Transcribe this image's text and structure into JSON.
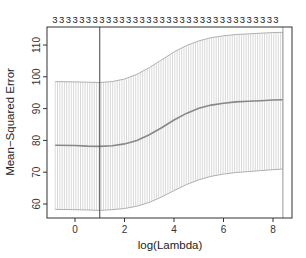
{
  "chart_data": {
    "type": "line",
    "title": "",
    "xlabel": "log(Lambda)",
    "ylabel": "Mean−Squared Error",
    "xlim": [
      -1.1,
      8.75
    ],
    "ylim": [
      56.5,
      115.5
    ],
    "x_ticks": [
      0,
      2,
      4,
      6,
      8
    ],
    "x_tick_labels": [
      "0",
      "2",
      "4",
      "6",
      "8"
    ],
    "y_ticks": [
      60,
      70,
      80,
      90,
      100,
      110
    ],
    "y_tick_labels": [
      "60",
      "70",
      "80",
      "90",
      "100",
      "110"
    ],
    "grid": false,
    "legend": null,
    "top_axis_label_value": "3",
    "top_axis_label_count": 34,
    "vertical_lines": [
      {
        "name": "lambda.min",
        "x": 1.0
      },
      {
        "name": "lambda.1se",
        "x": 8.4
      }
    ],
    "series": [
      {
        "name": "cv mean",
        "x": [
          -0.8,
          0.0,
          0.5,
          1.0,
          1.5,
          2.0,
          2.5,
          3.0,
          3.5,
          4.0,
          4.5,
          5.0,
          5.5,
          6.0,
          6.5,
          7.0,
          7.5,
          8.0,
          8.4
        ],
        "y": [
          78.5,
          78.4,
          78.2,
          78.1,
          78.3,
          78.9,
          80.0,
          81.8,
          84.0,
          86.4,
          88.5,
          90.1,
          91.1,
          91.7,
          92.1,
          92.3,
          92.5,
          92.7,
          92.8
        ]
      },
      {
        "name": "upper band (mean + 1 SE)",
        "x": [
          -0.8,
          0.0,
          0.5,
          1.0,
          1.5,
          2.0,
          2.5,
          3.0,
          3.5,
          4.0,
          4.5,
          5.0,
          5.5,
          6.0,
          6.5,
          7.0,
          7.5,
          8.0,
          8.4
        ],
        "y": [
          98.5,
          98.4,
          98.3,
          98.2,
          98.5,
          99.3,
          100.8,
          102.9,
          105.3,
          107.8,
          109.8,
          111.3,
          112.3,
          112.9,
          113.3,
          113.5,
          113.7,
          113.9,
          114.0
        ]
      },
      {
        "name": "lower band (mean - 1 SE)",
        "x": [
          -0.8,
          0.0,
          0.5,
          1.0,
          1.5,
          2.0,
          2.5,
          3.0,
          3.5,
          4.0,
          4.5,
          5.0,
          5.5,
          6.0,
          6.5,
          7.0,
          7.5,
          8.0,
          8.4
        ],
        "y": [
          58.3,
          58.2,
          58.1,
          58.0,
          58.2,
          58.6,
          59.3,
          60.5,
          62.2,
          64.2,
          66.1,
          67.6,
          68.7,
          69.4,
          69.9,
          70.2,
          70.5,
          70.8,
          71.0
        ]
      }
    ],
    "colors": {
      "mean_line": "#888888",
      "band": "#c8c8c8",
      "axes": "#333333",
      "vline": "#555555"
    }
  }
}
